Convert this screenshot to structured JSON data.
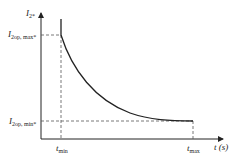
{
  "diagram": {
    "y_axis_label": {
      "main": "I",
      "sub": "2*"
    },
    "x_axis_label": "t (s)",
    "y_level_max": {
      "main": "I",
      "sub": "2op, max*"
    },
    "y_level_min": {
      "main": "I",
      "sub": "2op, min*"
    },
    "t_min": {
      "main": "t",
      "sub": "min"
    },
    "t_max": {
      "main": "t",
      "sub": "max"
    },
    "colors": {
      "line": "#222222",
      "dashed": "#555555"
    }
  }
}
